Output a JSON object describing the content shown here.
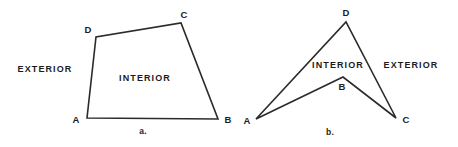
{
  "figure": {
    "background_color": "#ffffff",
    "stroke_color": "#2b2b2b",
    "text_color": "#1c1c1c",
    "width": 458,
    "height": 147,
    "panels": [
      {
        "id": "panel-a",
        "caption": "a.",
        "caption_pos": {
          "x": 143,
          "y": 131
        },
        "shape_type": "convex-quadrilateral",
        "vertex_order": "A-B-C-D",
        "vertices": [
          {
            "name": "A",
            "x": 87,
            "y": 118,
            "label_x": 76,
            "label_y": 119
          },
          {
            "name": "B",
            "x": 218,
            "y": 119,
            "label_x": 228,
            "label_y": 119
          },
          {
            "name": "C",
            "x": 181,
            "y": 23,
            "label_x": 184,
            "label_y": 14
          },
          {
            "name": "D",
            "x": 96,
            "y": 37,
            "label_x": 88,
            "label_y": 29
          }
        ],
        "regions": [
          {
            "name": "EXTERIOR",
            "x": 45,
            "y": 69
          },
          {
            "name": "INTERIOR",
            "x": 145,
            "y": 78
          }
        ]
      },
      {
        "id": "panel-b",
        "caption": "b.",
        "caption_pos": {
          "x": 330,
          "y": 132
        },
        "shape_type": "concave-quadrilateral-dart",
        "vertex_order": "A-B-C-D",
        "vertices": [
          {
            "name": "A",
            "x": 256,
            "y": 119,
            "label_x": 247,
            "label_y": 120
          },
          {
            "name": "B",
            "x": 343,
            "y": 77,
            "label_x": 342,
            "label_y": 86
          },
          {
            "name": "C",
            "x": 396,
            "y": 118,
            "label_x": 406,
            "label_y": 119
          },
          {
            "name": "D",
            "x": 346,
            "y": 22,
            "label_x": 346,
            "label_y": 12
          }
        ],
        "regions": [
          {
            "name": "INTERIOR",
            "x": 338,
            "y": 65
          },
          {
            "name": "EXTERIOR",
            "x": 411,
            "y": 65
          }
        ]
      }
    ]
  }
}
